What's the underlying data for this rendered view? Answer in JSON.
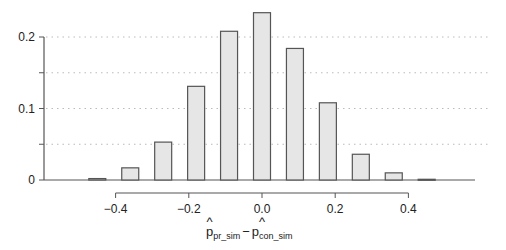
{
  "chart_data": {
    "type": "bar",
    "title": "",
    "xlabel": "p̂_pr_sim − p̂_con_sim",
    "xlabel_parts": {
      "hat1": "^",
      "base1": "p",
      "sub1": "pr_sim",
      "minus": "−",
      "hat2": "^",
      "base2": "p",
      "sub2": "con_sim"
    },
    "ylabel": "",
    "x": [
      -0.45,
      -0.36,
      -0.27,
      -0.18,
      -0.09,
      0.0,
      0.09,
      0.18,
      0.27,
      0.36,
      0.45
    ],
    "values": [
      0.002,
      0.017,
      0.053,
      0.131,
      0.208,
      0.234,
      0.184,
      0.108,
      0.036,
      0.01,
      0.001
    ],
    "xlim": [
      -0.58,
      0.6
    ],
    "ylim": [
      0,
      0.24
    ],
    "x_ticks": [
      -0.4,
      -0.2,
      0.0,
      0.2,
      0.4
    ],
    "x_tick_labels": [
      "−0.4",
      "−0.2",
      "0.0",
      "0.2",
      "0.4"
    ],
    "y_ticks": [
      0,
      0.05,
      0.1,
      0.15,
      0.2
    ],
    "y_tick_labels": [
      "0",
      "",
      "0.1",
      "",
      "0.2"
    ],
    "grid": {
      "horizontal": true,
      "style": "dotted",
      "values": [
        0.05,
        0.1,
        0.15,
        0.2
      ]
    },
    "legend": null,
    "colors": {
      "bar_fill": "#e6e6e6",
      "bar_stroke": "#555555",
      "axis": "#555555",
      "grid": "#bbbbbb"
    }
  }
}
